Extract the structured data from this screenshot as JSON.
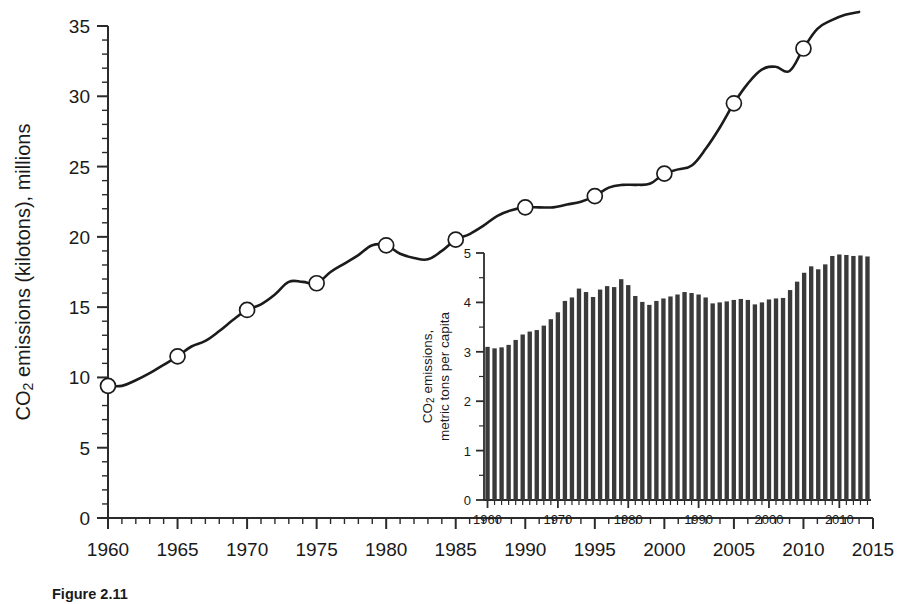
{
  "figure": {
    "caption": "Figure 2.11"
  },
  "chart_data": [
    {
      "id": "main",
      "type": "line",
      "title": "",
      "xlabel": "",
      "ylabel": "CO2 emissions (kilotons), millions",
      "ylabel_parts": {
        "prefix": "CO",
        "sub": "2",
        "suffix": " emissions (kilotons), millions"
      },
      "xlim": [
        1960,
        2015
      ],
      "ylim": [
        0,
        35
      ],
      "xticks": [
        1960,
        1965,
        1970,
        1975,
        1980,
        1985,
        1990,
        1995,
        2000,
        2005,
        2010,
        2015
      ],
      "xticklabels": [
        "1960",
        "1965",
        "1970",
        "1975",
        "1980",
        "1985",
        "1990",
        "1995",
        "2000",
        "2005",
        "2010",
        "2015"
      ],
      "yticks": [
        0,
        5,
        10,
        15,
        20,
        25,
        30,
        35
      ],
      "yticklabels": [
        "0",
        "5",
        "10",
        "15",
        "20",
        "25",
        "30",
        "35"
      ],
      "minor_tick_step_x": 1,
      "minor_tick_step_y": 1,
      "grid": false,
      "legend": "none",
      "marker_style": "open-circle",
      "marker_years": [
        1960,
        1965,
        1970,
        1975,
        1980,
        1985,
        1990,
        1995,
        2000,
        2005,
        2010
      ],
      "x": [
        1960,
        1961,
        1962,
        1963,
        1964,
        1965,
        1966,
        1967,
        1968,
        1969,
        1970,
        1971,
        1972,
        1973,
        1974,
        1975,
        1976,
        1977,
        1978,
        1979,
        1980,
        1981,
        1982,
        1983,
        1984,
        1985,
        1986,
        1987,
        1988,
        1989,
        1990,
        1991,
        1992,
        1993,
        1994,
        1995,
        1996,
        1997,
        1998,
        1999,
        2000,
        2001,
        2002,
        2003,
        2004,
        2005,
        2006,
        2007,
        2008,
        2009,
        2010,
        2011,
        2012,
        2013,
        2014
      ],
      "values": [
        9.4,
        9.4,
        9.8,
        10.3,
        10.9,
        11.5,
        12.2,
        12.6,
        13.3,
        14.1,
        14.8,
        15.2,
        15.9,
        16.8,
        16.8,
        16.7,
        17.5,
        18.1,
        18.7,
        19.4,
        19.4,
        18.8,
        18.5,
        18.4,
        19.0,
        19.8,
        20.2,
        20.8,
        21.5,
        21.9,
        22.1,
        22.1,
        22.1,
        22.3,
        22.5,
        22.9,
        23.5,
        23.7,
        23.7,
        23.8,
        24.5,
        24.8,
        25.1,
        26.3,
        27.8,
        29.5,
        30.9,
        31.9,
        32.1,
        31.8,
        33.4,
        34.8,
        35.4,
        35.8,
        36.0
      ]
    },
    {
      "id": "inset",
      "type": "bar",
      "title": "",
      "xlabel": "",
      "ylabel": "CO2 emissions, metric tons per capita",
      "ylabel_line1_parts": {
        "prefix": "CO",
        "sub": "2",
        "suffix": " emissions,"
      },
      "ylabel_line2": "metric tons per capita",
      "xlim": [
        1959.5,
        2014.5
      ],
      "ylim": [
        0,
        5
      ],
      "xticks": [
        1960,
        1970,
        1980,
        1990,
        2000,
        2010
      ],
      "xticklabels": [
        "1960",
        "1970",
        "1980",
        "1990",
        "2000",
        "2010"
      ],
      "yticks": [
        0,
        1,
        2,
        3,
        4,
        5
      ],
      "yticklabels": [
        "0",
        "1",
        "2",
        "3",
        "4",
        "5"
      ],
      "minor_tick_step_x": 1,
      "minor_tick_step_y": 0.5,
      "grid": false,
      "legend": "none",
      "categories": [
        1960,
        1961,
        1962,
        1963,
        1964,
        1965,
        1966,
        1967,
        1968,
        1969,
        1970,
        1971,
        1972,
        1973,
        1974,
        1975,
        1976,
        1977,
        1978,
        1979,
        1980,
        1981,
        1982,
        1983,
        1984,
        1985,
        1986,
        1987,
        1988,
        1989,
        1990,
        1991,
        1992,
        1993,
        1994,
        1995,
        1996,
        1997,
        1998,
        1999,
        2000,
        2001,
        2002,
        2003,
        2004,
        2005,
        2006,
        2007,
        2008,
        2009,
        2010,
        2011,
        2012,
        2013,
        2014
      ],
      "values": [
        3.1,
        3.07,
        3.09,
        3.14,
        3.24,
        3.35,
        3.41,
        3.44,
        3.53,
        3.66,
        3.8,
        4.03,
        4.1,
        4.28,
        4.21,
        4.11,
        4.26,
        4.33,
        4.31,
        4.47,
        4.35,
        4.13,
        4.01,
        3.95,
        4.03,
        4.08,
        4.12,
        4.16,
        4.21,
        4.19,
        4.16,
        4.1,
        3.98,
        4.0,
        4.02,
        4.05,
        4.07,
        4.05,
        3.96,
        4.0,
        4.06,
        4.08,
        4.09,
        4.25,
        4.42,
        4.6,
        4.73,
        4.67,
        4.77,
        4.94,
        4.97,
        4.96,
        4.94,
        4.95,
        4.93
      ]
    }
  ]
}
